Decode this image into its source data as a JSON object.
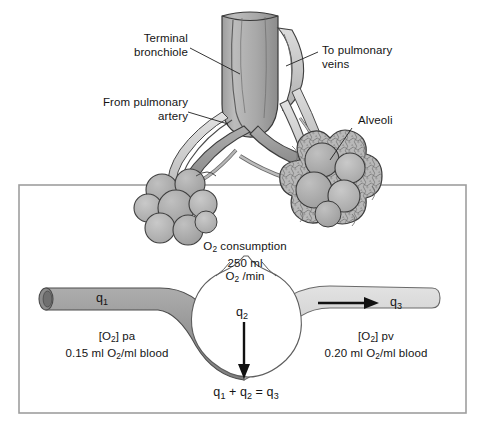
{
  "figure": {
    "background": "#ffffff",
    "line_color": "#2b2b2b",
    "tissue_fill_dark": "#9a9a9a",
    "tissue_fill_mid": "#b4b4b4",
    "tissue_fill_light": "#cbcbcb",
    "panel_border": "#9e9e9e"
  },
  "anatomy_labels": [
    {
      "id": "terminal-bronchiole",
      "line1": "Terminal",
      "line2": "bronchiole",
      "align": "right"
    },
    {
      "id": "from-pulmonary-artery",
      "line1": "From pulmonary",
      "line2": "artery",
      "align": "right"
    },
    {
      "id": "to-pulmonary-veins",
      "line1": "To pulmonary",
      "line2": "veins",
      "align": "left"
    },
    {
      "id": "alveoli",
      "line1": "Alveoli",
      "line2": "",
      "align": "left"
    }
  ],
  "consumption": {
    "line1_pre": "O",
    "line1_sub": "2",
    "line1_post": " consumption",
    "line2": "250 ml",
    "line3_pre": "O",
    "line3_sub": "2",
    "line3_post": " /min"
  },
  "flows": {
    "q1": {
      "label_pre": "q",
      "label_sub": "1"
    },
    "q2": {
      "label_pre": "q",
      "label_sub": "2"
    },
    "q3": {
      "label_pre": "q",
      "label_sub": "3"
    }
  },
  "arterial": {
    "bracket_pre": "[O",
    "bracket_sub": "2",
    "bracket_post": "] pa",
    "value_pre": "0.15 ml O",
    "value_sub": "2",
    "value_post": "/ml blood"
  },
  "venous": {
    "bracket_pre": "[O",
    "bracket_sub": "2",
    "bracket_post": "] pv",
    "value_pre": "0.20 ml O",
    "value_sub": "2",
    "value_post": "/ml blood"
  },
  "equation": {
    "q1_pre": "q",
    "q1_sub": "1",
    "plus": " + ",
    "q2_pre": "q",
    "q2_sub": "2",
    "equals": " = ",
    "q3_pre": "q",
    "q3_sub": "3"
  }
}
